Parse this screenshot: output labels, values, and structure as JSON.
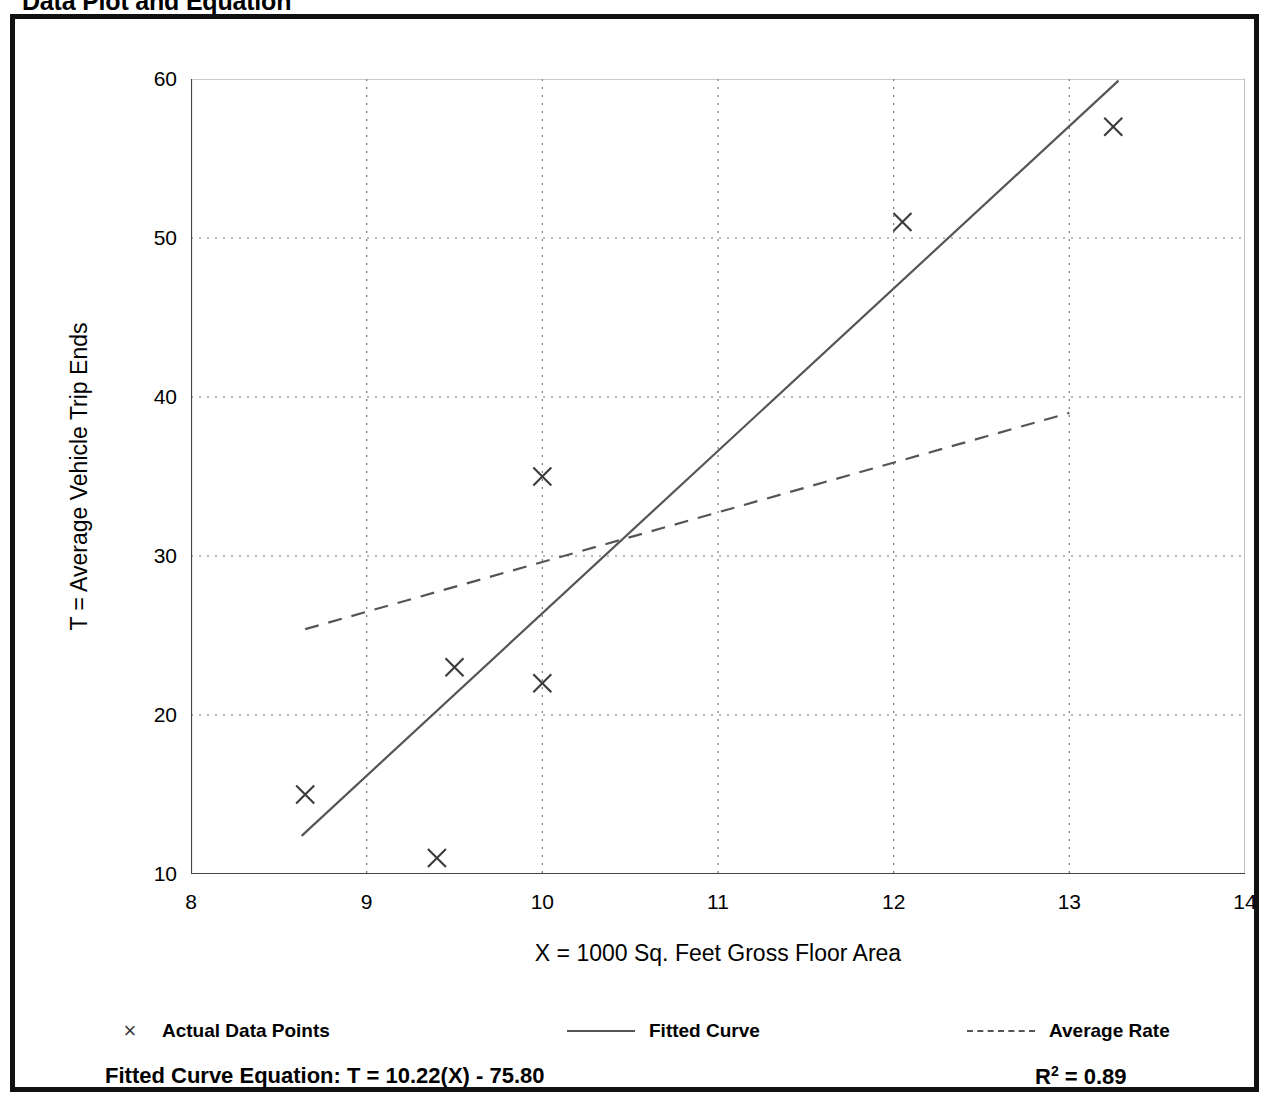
{
  "page_title": "Data Plot and Equation",
  "axes": {
    "y_title": "T = Average Vehicle Trip Ends",
    "x_title": "X = 1000 Sq. Feet Gross Floor Area"
  },
  "legend": {
    "items": [
      {
        "label": "Actual Data Points",
        "marker": "×",
        "style": "marker"
      },
      {
        "label": "Fitted Curve",
        "style": "solid"
      },
      {
        "label": "Average Rate",
        "style": "dashed"
      }
    ]
  },
  "footer": {
    "equation_label": "Fitted Curve Equation:",
    "equation": "T = 10.22(X) - 75.80",
    "equation_full": "Fitted Curve Equation:  T = 10.22(X) - 75.80",
    "r_squared_symbol": "R",
    "r_squared_exponent": "2",
    "r_squared_value": "= 0.89"
  },
  "colors": {
    "frame": "#111111",
    "axis": "#444444",
    "grid": "#777777",
    "marker": "#3b3b3b",
    "fitted_curve": "#555555",
    "average_rate": "#555555",
    "text": "#000000"
  },
  "chart_data": {
    "type": "scatter",
    "title": "Data Plot and Equation",
    "xlabel": "X = 1000 Sq. Feet Gross Floor Area",
    "ylabel": "T = Average Vehicle Trip Ends",
    "xlim": [
      8,
      14
    ],
    "ylim": [
      10,
      60
    ],
    "xticks": [
      8,
      9,
      10,
      11,
      12,
      13,
      14
    ],
    "yticks": [
      10,
      20,
      30,
      40,
      50,
      60
    ],
    "x_minor_step": 0.5,
    "y_minor_step": 5,
    "grid": true,
    "grid_style": "dotted",
    "legend_position": "below",
    "series": [
      {
        "name": "Actual Data Points",
        "type": "scatter",
        "marker": "x",
        "points": [
          {
            "x": 8.65,
            "y": 15
          },
          {
            "x": 9.4,
            "y": 11
          },
          {
            "x": 9.5,
            "y": 23
          },
          {
            "x": 10.0,
            "y": 22
          },
          {
            "x": 10.0,
            "y": 35
          },
          {
            "x": 12.05,
            "y": 51
          },
          {
            "x": 13.25,
            "y": 57
          }
        ]
      },
      {
        "name": "Fitted Curve",
        "type": "line",
        "style": "solid",
        "equation": "T = 10.22(X) - 75.80",
        "slope": 10.22,
        "intercept": -75.8,
        "r_squared": 0.89,
        "endpoints": [
          {
            "x": 8.63,
            "y": 12.4
          },
          {
            "x": 13.28,
            "y": 59.9
          }
        ]
      },
      {
        "name": "Average Rate",
        "type": "line",
        "style": "dashed",
        "endpoints": [
          {
            "x": 8.65,
            "y": 25.4
          },
          {
            "x": 13.0,
            "y": 39.0
          }
        ]
      }
    ]
  }
}
